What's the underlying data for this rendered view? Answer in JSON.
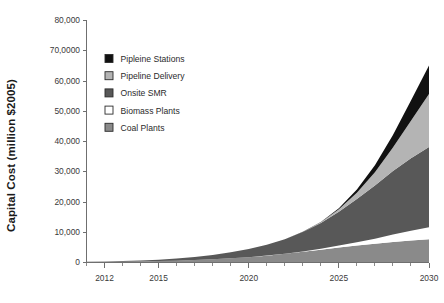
{
  "chart_data": {
    "type": "area",
    "title": "",
    "subtitle": "",
    "xlabel": "",
    "ylabel": "Capital Cost (million $2005)",
    "xlim": [
      2011,
      2030
    ],
    "ylim": [
      0,
      80000
    ],
    "grid": false,
    "legend_position": "inside-top-left",
    "stacked": true,
    "stack_order_top_to_bottom": [
      "Pipleine Stations",
      "Pipeline Delivery",
      "Onsite SMR",
      "Biomass Plants",
      "Coal Plants"
    ],
    "x": [
      2011,
      2012,
      2013,
      2014,
      2015,
      2016,
      2017,
      2018,
      2019,
      2020,
      2021,
      2022,
      2023,
      2024,
      2025,
      2026,
      2027,
      2028,
      2029,
      2030
    ],
    "xticks": [
      2012,
      2015,
      2020,
      2025,
      2030
    ],
    "xtick_labels": [
      "2012",
      "2015",
      "2020",
      "2025",
      "2030"
    ],
    "yticks": [
      0,
      10000,
      20000,
      30000,
      40000,
      50000,
      60000,
      70000,
      80000
    ],
    "ytick_labels": [
      "0",
      "10,000",
      "20,000",
      "30,000",
      "40,000",
      "50,000",
      "60,0000",
      "70,0000",
      "80,000"
    ],
    "ytick_labels_display": [
      "0",
      "10,000",
      "20,000",
      "30,000",
      "40,000",
      "50,000",
      "60,000",
      "70,0000",
      "80,000"
    ],
    "series": [
      {
        "name": "Coal Plants",
        "color": "#8a8a8a",
        "swatch": "medium-gray-filled",
        "values": [
          40,
          70,
          120,
          190,
          290,
          430,
          620,
          880,
          1200,
          1600,
          2100,
          2700,
          3350,
          4050,
          4800,
          5450,
          6050,
          6650,
          7100,
          7500
        ]
      },
      {
        "name": "Biomass Plants",
        "color": "#ffffff",
        "swatch": "white-outline",
        "values": [
          0,
          0,
          0,
          0,
          0,
          0,
          0,
          0,
          0,
          0,
          20,
          60,
          150,
          330,
          620,
          1050,
          1650,
          2400,
          3200,
          4000
        ]
      },
      {
        "name": "Onsite SMR",
        "color": "#585858",
        "swatch": "dark-gray-filled",
        "values": [
          60,
          110,
          190,
          310,
          480,
          720,
          1040,
          1460,
          2000,
          2700,
          3600,
          4800,
          6400,
          8500,
          11200,
          14300,
          17600,
          21000,
          24000,
          26500
        ]
      },
      {
        "name": "Pipeline Delivery",
        "color": "#b4b4b4",
        "swatch": "light-gray-filled",
        "values": [
          0,
          0,
          0,
          0,
          0,
          0,
          0,
          0,
          0,
          0,
          0,
          0,
          50,
          250,
          800,
          2100,
          4400,
          7800,
          12400,
          17500
        ]
      },
      {
        "name": "Pipleine Stations",
        "color": "#111111",
        "swatch": "black-filled",
        "values": [
          0,
          0,
          0,
          0,
          0,
          0,
          0,
          0,
          0,
          0,
          0,
          0,
          20,
          110,
          380,
          1050,
          2300,
          4100,
          6700,
          9500
        ]
      }
    ],
    "totals_2030": 65000,
    "colors": {
      "pipeline_stations": "#111111",
      "pipeline_delivery": "#b4b4b4",
      "onsite_smr": "#585858",
      "biomass_plants": "#ffffff",
      "coal_plants": "#8a8a8a",
      "axis": "#6f6f6f",
      "text": "#2b2b2b",
      "background": "#ffffff"
    }
  },
  "legend": {
    "items": [
      {
        "label": "Pipleine Stations",
        "color": "#111111",
        "swatch": "black-filled"
      },
      {
        "label": "Pipeline Delivery",
        "color": "#b4b4b4",
        "swatch": "light-gray-filled"
      },
      {
        "label": "Onsite SMR",
        "color": "#585858",
        "swatch": "dark-gray-filled"
      },
      {
        "label": "Biomass Plants",
        "color": "#ffffff",
        "swatch": "white-outline"
      },
      {
        "label": "Coal Plants",
        "color": "#8a8a8a",
        "swatch": "medium-gray-filled"
      }
    ]
  }
}
